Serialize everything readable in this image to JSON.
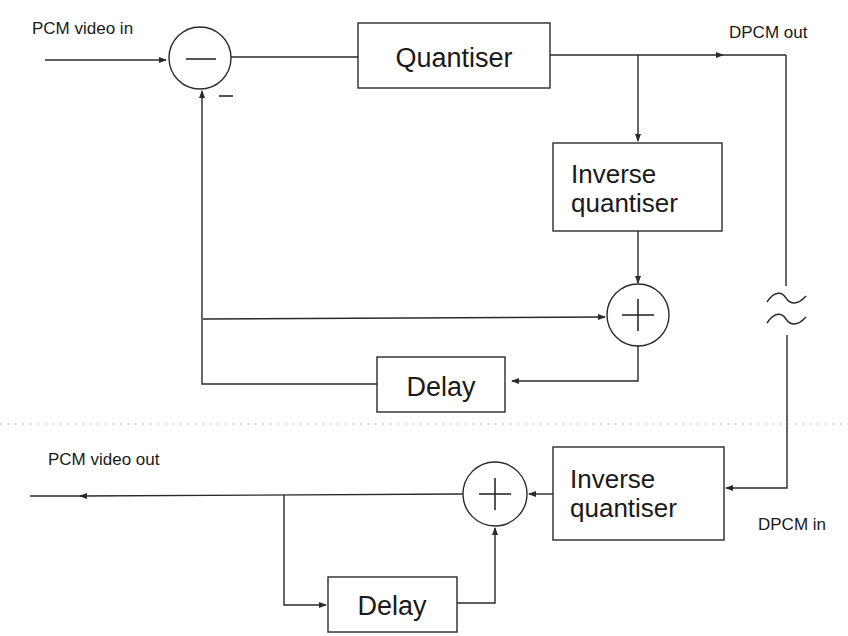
{
  "diagram": {
    "colors": {
      "line": "#2a2a2a",
      "text": "#1a1a1a",
      "divider": "#9a9a9a",
      "background": "#ffffff"
    },
    "encoder": {
      "input_label": "PCM video in",
      "output_label": "DPCM out",
      "subtractor_sign": "−",
      "feedback_sign": "−",
      "quantiser_label": "Quantiser",
      "inverse_quantiser_line1": "Inverse",
      "inverse_quantiser_line2": "quantiser",
      "adder_sign": "+",
      "delay_label": "Delay"
    },
    "channel": {
      "break_symbol": "≈"
    },
    "decoder": {
      "input_label": "DPCM in",
      "output_label": "PCM video out",
      "inverse_quantiser_line1": "Inverse",
      "inverse_quantiser_line2": "quantiser",
      "adder_sign": "+",
      "delay_label": "Delay"
    }
  }
}
